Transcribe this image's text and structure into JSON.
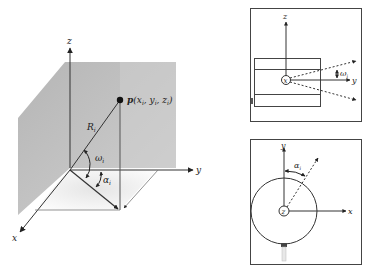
{
  "main_diagram": {
    "axes": {
      "x": "x",
      "y": "y",
      "z": "z"
    },
    "point_label": "p",
    "point_coords": "(x_i, y_i, z_i)",
    "point_coords_text": "(x",
    "sub_i": "i",
    "comma_y": ", y",
    "comma_z": ", z",
    "close_paren": ")",
    "radius_label": "R",
    "radius_sub": "i",
    "elevation_angle": "ω",
    "elevation_sub": "i",
    "azimuth_angle": "α",
    "azimuth_sub": "i",
    "colors": {
      "shade_dark": "#b4b4b4",
      "shade_light": "#dcdcdc",
      "line": "#333333"
    }
  },
  "side_view_panel": {
    "axes": {
      "z": "z",
      "y": "y",
      "center": "x"
    },
    "angle": "ω",
    "angle_sub": "i"
  },
  "top_view_panel": {
    "axes": {
      "y": "y",
      "x": "x",
      "center": "z"
    },
    "angle": "α",
    "angle_sub": "i"
  }
}
